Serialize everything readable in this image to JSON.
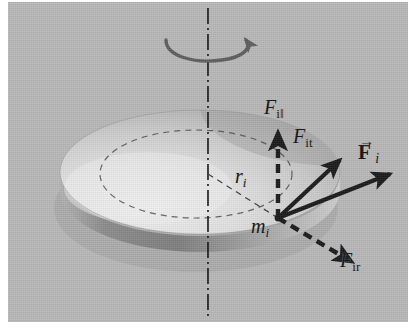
{
  "figure": {
    "background_color": "#ffffff",
    "panel_color": "#b9b9b9",
    "ink_color": "#111111",
    "disk_light_color": "#e3e3e3",
    "disk_mid_color": "#c6c6c6",
    "disk_shadow_color": "#8e8e8e"
  },
  "labels": {
    "force_parallel": {
      "base": "F",
      "sub": "i‖"
    },
    "force_tangential": {
      "base": "F",
      "sub": "it"
    },
    "force_total": {
      "base": "F",
      "sub": "i",
      "arrow": "→"
    },
    "radius": {
      "base": "r",
      "sub": "i"
    },
    "mass_element": {
      "base": "m",
      "sub": "i"
    },
    "force_radial": {
      "base": "F",
      "sub": "ir"
    }
  },
  "elements": {
    "rotation_axis": "vertical dash-dot rotation axis",
    "rotation_arrow": "curved rotation direction arrow at top of axis",
    "disk": "shaded 3D disk seen in perspective",
    "radius_line": "dashed radius from axis to mass element",
    "dashed_circle": "dashed circular path of mass element on disk face",
    "mass_point": "mass element point on disk"
  },
  "geometry": {
    "panel": {
      "x": 8,
      "y": 2,
      "width": 400,
      "height": 320
    },
    "axis_x": 200,
    "axis_top_y": 6,
    "axis_bottom_y": 318,
    "disk_center": {
      "x": 192,
      "y": 172
    },
    "disk_rx": 140,
    "disk_ry": 62,
    "disk_thickness": 26,
    "mass_point": {
      "x": 270,
      "y": 216
    },
    "vectors": [
      {
        "name": "force_parallel",
        "angle_deg": 90,
        "length": 86,
        "style": "dashed"
      },
      {
        "name": "force_tangential",
        "angle_deg": 43,
        "length": 84,
        "style": "solid"
      },
      {
        "name": "force_total",
        "angle_deg": 21,
        "length": 120,
        "style": "solid"
      },
      {
        "name": "force_radial",
        "angle_deg": -31,
        "length": 86,
        "style": "dashed"
      }
    ]
  }
}
